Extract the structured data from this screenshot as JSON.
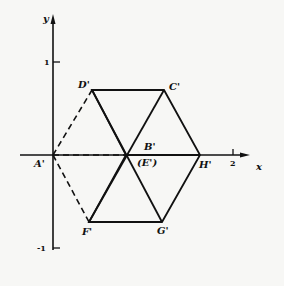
{
  "axes": {
    "x_label": "x",
    "y_label": "y",
    "ticks": {
      "y_pos": "1",
      "y_neg": "-1",
      "x_pos": "2"
    }
  },
  "points": {
    "A": "A'",
    "B": "B'",
    "E": "(E')",
    "C": "C'",
    "D": "D'",
    "F": "F'",
    "G": "G'",
    "H": "H'"
  },
  "colors": {
    "ink": "#111111",
    "paper": "#f7f7f5"
  }
}
